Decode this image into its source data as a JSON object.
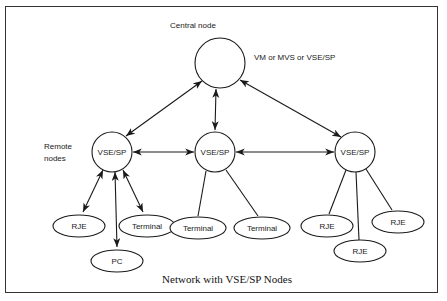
{
  "figure": {
    "caption": "Network with VSE/SP Nodes",
    "frame_color": "#333333",
    "line_color": "#1a1a1a",
    "background": "#ffffff"
  },
  "annotations": {
    "central_node_label": "Central node",
    "central_node_systems": "VM or MVS or VSE/SP",
    "remote_nodes_line1": "Remote",
    "remote_nodes_line2": "nodes"
  },
  "nodes": {
    "central": {
      "label": "",
      "shape": "circle",
      "cx": 220,
      "cy": 63,
      "r": 25
    },
    "remote": [
      {
        "id": "remote-left",
        "label": "VSE/SP",
        "shape": "circle",
        "cx": 112,
        "cy": 152,
        "r": 20
      },
      {
        "id": "remote-middle",
        "label": "VSE/SP",
        "shape": "circle",
        "cx": 215,
        "cy": 152,
        "r": 20
      },
      {
        "id": "remote-right",
        "label": "VSE/SP",
        "shape": "circle",
        "cx": 355,
        "cy": 152,
        "r": 20
      }
    ],
    "terminals": [
      {
        "id": "left-rje",
        "label": "RJE",
        "shape": "ellipse",
        "cx": 79,
        "cy": 226,
        "rx": 26,
        "ry": 11,
        "parent": "remote-left",
        "arrow": "double"
      },
      {
        "id": "left-terminal",
        "label": "Terminal",
        "shape": "ellipse",
        "cx": 147,
        "cy": 226,
        "rx": 28,
        "ry": 11,
        "parent": "remote-left",
        "arrow": "double"
      },
      {
        "id": "left-pc",
        "label": "PC",
        "shape": "ellipse",
        "cx": 117,
        "cy": 261,
        "rx": 26,
        "ry": 11,
        "parent": "remote-left",
        "arrow": "double"
      },
      {
        "id": "mid-terminal-1",
        "label": "Terminal",
        "shape": "ellipse",
        "cx": 198,
        "cy": 228,
        "rx": 28,
        "ry": 11,
        "parent": "remote-middle",
        "arrow": "none"
      },
      {
        "id": "mid-terminal-2",
        "label": "Terminal",
        "shape": "ellipse",
        "cx": 262,
        "cy": 228,
        "rx": 28,
        "ry": 11,
        "parent": "remote-middle",
        "arrow": "none"
      },
      {
        "id": "right-rje-1",
        "label": "RJE",
        "shape": "ellipse",
        "cx": 327,
        "cy": 226,
        "rx": 26,
        "ry": 11,
        "parent": "remote-right",
        "arrow": "none"
      },
      {
        "id": "right-rje-2",
        "label": "RJE",
        "shape": "ellipse",
        "cx": 398,
        "cy": 222,
        "rx": 26,
        "ry": 11,
        "parent": "remote-right",
        "arrow": "none"
      },
      {
        "id": "right-rje-3",
        "label": "RJE",
        "shape": "ellipse",
        "cx": 360,
        "cy": 251,
        "rx": 26,
        "ry": 11,
        "parent": "remote-right",
        "arrow": "none"
      }
    ]
  },
  "links": {
    "central_to_remote": [
      {
        "from": "central",
        "to": "remote-left",
        "arrow": "double"
      },
      {
        "from": "central",
        "to": "remote-middle",
        "arrow": "double"
      },
      {
        "from": "central",
        "to": "remote-right",
        "arrow": "double"
      }
    ],
    "peer_links": [
      {
        "from": "remote-left",
        "to": "remote-middle",
        "arrow": "double"
      },
      {
        "from": "remote-middle",
        "to": "remote-right",
        "arrow": "double"
      }
    ]
  }
}
